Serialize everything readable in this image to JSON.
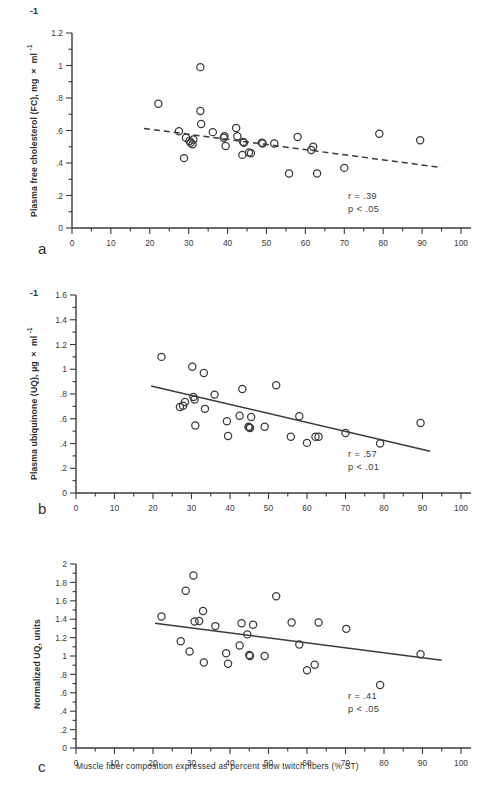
{
  "figure": {
    "caption_xlabel": "Muscle fiber composition expressed as percent slow twitch fibers (% ST)",
    "background": "#ffffff",
    "ink": "#3a3a3a"
  },
  "panels": [
    {
      "letter": "a",
      "ylabel_main": "Plasma free cholesterol (FC), mg × ml",
      "ylabel_sup": "-1",
      "exp_marker": "-1",
      "stat_r": "r = .39",
      "stat_p": "p < .05",
      "xticks": [
        "0",
        "10",
        "20",
        "30",
        "40",
        "50",
        "60",
        "70",
        "80",
        "90",
        "100"
      ],
      "yticks": [
        "0",
        ".2",
        ".4",
        ".6",
        ".8",
        "1",
        "1.2"
      ]
    },
    {
      "letter": "b",
      "ylabel_main": "Plasma ubiquinone (UQ), µg × ml",
      "ylabel_sup": "-1",
      "exp_marker": "-1",
      "stat_r": "r = .57",
      "stat_p": "p < .01",
      "xticks": [
        "0",
        "10",
        "20",
        "30",
        "40",
        "50",
        "60",
        "70",
        "80",
        "90",
        "100"
      ],
      "yticks": [
        "0",
        ".2",
        ".4",
        ".6",
        ".8",
        "1",
        "1.2",
        "1.4",
        "1.6"
      ]
    },
    {
      "letter": "c",
      "ylabel_main": "Normalized UQ, units",
      "ylabel_sup": "",
      "exp_marker": "",
      "stat_r": "r = .41",
      "stat_p": "p < .05",
      "xticks": [
        "0",
        "10",
        "20",
        "30",
        "40",
        "50",
        "60",
        "70",
        "80",
        "90",
        "100"
      ],
      "yticks": [
        "0",
        ".2",
        ".4",
        ".6",
        ".8",
        "1",
        "1.2",
        "1.4",
        "1.6",
        "1.8",
        "2"
      ]
    }
  ],
  "chart_data": [
    {
      "type": "scatter",
      "panel": "a",
      "title": "",
      "xlabel": "",
      "ylabel": "Plasma free cholesterol (FC), mg × ml^-1",
      "xlim": [
        0,
        100
      ],
      "ylim": [
        0,
        1.2
      ],
      "xticks": [
        0,
        10,
        20,
        30,
        40,
        50,
        60,
        70,
        80,
        90,
        100
      ],
      "yticks": [
        0,
        0.2,
        0.4,
        0.6,
        0.8,
        1.0,
        1.2
      ],
      "grid": false,
      "legend": "none",
      "annotations": [
        "r = .39",
        "p < .05"
      ],
      "marker": "open-circle",
      "points": [
        [
          22.2,
          0.765
        ],
        [
          27.5,
          0.595
        ],
        [
          28.8,
          0.43
        ],
        [
          29.3,
          0.555
        ],
        [
          30.2,
          0.535
        ],
        [
          30.5,
          0.525
        ],
        [
          31.0,
          0.515
        ],
        [
          31.2,
          0.545
        ],
        [
          33.0,
          0.99
        ],
        [
          33.0,
          0.72
        ],
        [
          33.2,
          0.64
        ],
        [
          36.2,
          0.59
        ],
        [
          39.0,
          0.555
        ],
        [
          39.2,
          0.565
        ],
        [
          39.5,
          0.505
        ],
        [
          42.2,
          0.615
        ],
        [
          42.5,
          0.565
        ],
        [
          43.8,
          0.45
        ],
        [
          44.0,
          0.53
        ],
        [
          44.2,
          0.525
        ],
        [
          45.5,
          0.465
        ],
        [
          46.0,
          0.46
        ],
        [
          48.8,
          0.525
        ],
        [
          49.0,
          0.52
        ],
        [
          52.0,
          0.52
        ],
        [
          55.8,
          0.335
        ],
        [
          58.0,
          0.56
        ],
        [
          61.5,
          0.48
        ],
        [
          62.0,
          0.5
        ],
        [
          63.0,
          0.335
        ],
        [
          70.0,
          0.37
        ],
        [
          79.0,
          0.58
        ],
        [
          89.5,
          0.54
        ]
      ],
      "fit_line": {
        "style": "dashed",
        "x": [
          18.5,
          95.0
        ],
        "y": [
          0.613,
          0.372
        ]
      }
    },
    {
      "type": "scatter",
      "panel": "b",
      "title": "",
      "xlabel": "",
      "ylabel": "Plasma ubiquinone (UQ), µg × ml^-1",
      "xlim": [
        0,
        100
      ],
      "ylim": [
        0,
        1.6
      ],
      "xticks": [
        0,
        10,
        20,
        30,
        40,
        50,
        60,
        70,
        80,
        90,
        100
      ],
      "yticks": [
        0,
        0.2,
        0.4,
        0.6,
        0.8,
        1.0,
        1.2,
        1.4,
        1.6
      ],
      "grid": false,
      "legend": "none",
      "annotations": [
        "r = .57",
        "p < .01"
      ],
      "marker": "open-circle",
      "points": [
        [
          22.2,
          1.1
        ],
        [
          27.0,
          0.695
        ],
        [
          27.8,
          0.705
        ],
        [
          28.3,
          0.735
        ],
        [
          30.2,
          1.02
        ],
        [
          30.5,
          0.775
        ],
        [
          30.8,
          0.755
        ],
        [
          31.0,
          0.545
        ],
        [
          33.2,
          0.97
        ],
        [
          33.5,
          0.68
        ],
        [
          36.0,
          0.795
        ],
        [
          39.2,
          0.58
        ],
        [
          39.5,
          0.46
        ],
        [
          42.5,
          0.625
        ],
        [
          43.2,
          0.84
        ],
        [
          44.8,
          0.535
        ],
        [
          45.0,
          0.53
        ],
        [
          45.2,
          0.525
        ],
        [
          45.5,
          0.615
        ],
        [
          49.0,
          0.535
        ],
        [
          52.0,
          0.87
        ],
        [
          55.8,
          0.455
        ],
        [
          58.0,
          0.62
        ],
        [
          60.0,
          0.405
        ],
        [
          62.2,
          0.455
        ],
        [
          63.0,
          0.455
        ],
        [
          70.0,
          0.485
        ],
        [
          79.0,
          0.4
        ],
        [
          89.5,
          0.565
        ]
      ],
      "fit_line": {
        "style": "solid",
        "x": [
          19.5,
          92.0
        ],
        "y": [
          0.865,
          0.338
        ]
      }
    },
    {
      "type": "scatter",
      "panel": "c",
      "title": "",
      "xlabel": "Muscle fiber composition expressed as percent slow twitch fibers (% ST)",
      "ylabel": "Normalized UQ, units",
      "xlim": [
        0,
        100
      ],
      "ylim": [
        0,
        2.0
      ],
      "xticks": [
        0,
        10,
        20,
        30,
        40,
        50,
        60,
        70,
        80,
        90,
        100
      ],
      "yticks": [
        0,
        0.2,
        0.4,
        0.6,
        0.8,
        1.0,
        1.2,
        1.4,
        1.6,
        1.8,
        2.0
      ],
      "grid": false,
      "legend": "none",
      "annotations": [
        "r = .41",
        "p < .05"
      ],
      "marker": "open-circle",
      "points": [
        [
          22.2,
          1.43
        ],
        [
          27.2,
          1.16
        ],
        [
          28.5,
          1.71
        ],
        [
          29.5,
          1.05
        ],
        [
          30.5,
          1.875
        ],
        [
          30.8,
          1.375
        ],
        [
          32.0,
          1.38
        ],
        [
          33.0,
          1.49
        ],
        [
          33.2,
          0.93
        ],
        [
          36.2,
          1.325
        ],
        [
          39.0,
          1.03
        ],
        [
          39.5,
          0.915
        ],
        [
          42.5,
          1.115
        ],
        [
          43.0,
          1.355
        ],
        [
          44.5,
          1.235
        ],
        [
          45.0,
          1.01
        ],
        [
          45.2,
          1.0
        ],
        [
          46.0,
          1.34
        ],
        [
          49.0,
          1.0
        ],
        [
          52.0,
          1.65
        ],
        [
          56.0,
          1.365
        ],
        [
          58.0,
          1.125
        ],
        [
          60.0,
          0.845
        ],
        [
          62.0,
          0.905
        ],
        [
          63.0,
          1.365
        ],
        [
          70.2,
          1.295
        ],
        [
          79.0,
          0.685
        ],
        [
          89.5,
          1.02
        ]
      ],
      "fit_line": {
        "style": "solid",
        "x": [
          20.5,
          95.0
        ],
        "y": [
          1.355,
          0.955
        ]
      }
    }
  ]
}
